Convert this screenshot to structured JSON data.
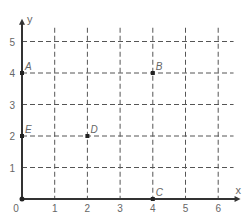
{
  "chart_data": {
    "type": "scatter",
    "title": "",
    "xlabel": "x",
    "ylabel": "y",
    "xlim": [
      0,
      6.5
    ],
    "ylim": [
      0,
      5.5
    ],
    "x_ticks": [
      "0",
      "1",
      "2",
      "3",
      "4",
      "5",
      "6"
    ],
    "y_ticks": [
      "1",
      "2",
      "3",
      "4",
      "5"
    ],
    "grid": "dashed",
    "points": [
      {
        "label": "A",
        "x": 0,
        "y": 4
      },
      {
        "label": "B",
        "x": 4,
        "y": 4
      },
      {
        "label": "C",
        "x": 4,
        "y": 0
      },
      {
        "label": "D",
        "x": 2,
        "y": 2
      },
      {
        "label": "E",
        "x": 0,
        "y": 2
      }
    ]
  },
  "colors": {
    "axis": "#333333",
    "grid": "#555555",
    "text": "#666666",
    "point": "#222222"
  }
}
